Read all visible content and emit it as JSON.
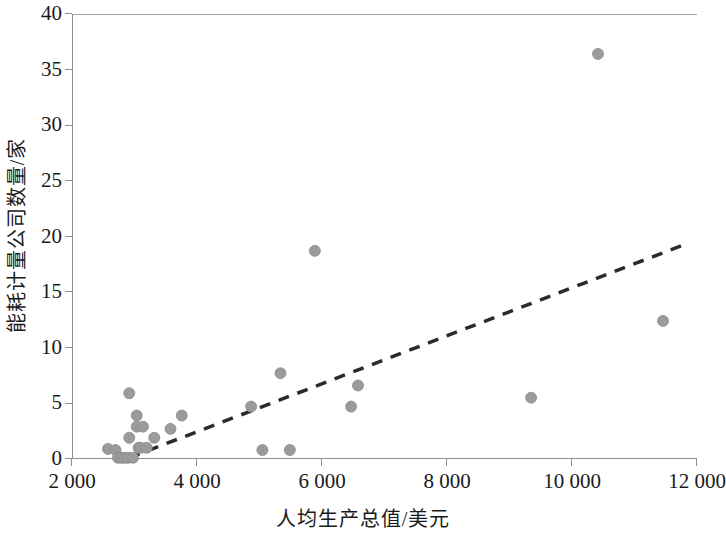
{
  "chart_data": {
    "type": "scatter",
    "title": "",
    "subtitle": "",
    "xlabel": "人均生产总值/美元",
    "ylabel": "能耗计量公司数量/家",
    "xlim": [
      2000,
      12000
    ],
    "ylim": [
      0,
      40
    ],
    "xticks": [
      2000,
      4000,
      6000,
      8000,
      10000,
      12000
    ],
    "xtick_labels": [
      "2 000",
      "4 000",
      "6 000",
      "8 000",
      "10 000",
      "12 000"
    ],
    "yticks": [
      0,
      5,
      10,
      15,
      20,
      25,
      30,
      35,
      40
    ],
    "ytick_labels": [
      "0",
      "5",
      "10",
      "15",
      "20",
      "25",
      "30",
      "35",
      "40"
    ],
    "grid": false,
    "legend": null,
    "marker": {
      "shape": "circle",
      "color": "#9b9b9b",
      "edge_color": "#8a8a8a",
      "size_px": 11
    },
    "series": [
      {
        "name": "能耗计量公司数量",
        "points": [
          {
            "x": 2560,
            "y": 1.0
          },
          {
            "x": 2680,
            "y": 0.9
          },
          {
            "x": 2720,
            "y": 0.2
          },
          {
            "x": 2780,
            "y": 0.2
          },
          {
            "x": 2830,
            "y": 0.2
          },
          {
            "x": 2880,
            "y": 0.2
          },
          {
            "x": 2900,
            "y": 6.0
          },
          {
            "x": 2900,
            "y": 2.0
          },
          {
            "x": 2960,
            "y": 0.2
          },
          {
            "x": 3020,
            "y": 4.0
          },
          {
            "x": 3020,
            "y": 3.0
          },
          {
            "x": 3050,
            "y": 1.1
          },
          {
            "x": 3080,
            "y": 1.1
          },
          {
            "x": 3120,
            "y": 3.0
          },
          {
            "x": 3180,
            "y": 1.1
          },
          {
            "x": 3300,
            "y": 2.0
          },
          {
            "x": 3560,
            "y": 2.8
          },
          {
            "x": 3740,
            "y": 4.0
          },
          {
            "x": 4850,
            "y": 4.8
          },
          {
            "x": 5030,
            "y": 0.9
          },
          {
            "x": 5320,
            "y": 7.8
          },
          {
            "x": 5470,
            "y": 0.9
          },
          {
            "x": 5870,
            "y": 18.8
          },
          {
            "x": 6450,
            "y": 4.8
          },
          {
            "x": 6560,
            "y": 6.7
          },
          {
            "x": 9330,
            "y": 5.6
          },
          {
            "x": 10400,
            "y": 36.5
          },
          {
            "x": 11440,
            "y": 12.5
          }
        ]
      }
    ],
    "trendline": {
      "style": "dashed",
      "color": "#2b2b2b",
      "width_px": 3.5,
      "x_start": 2900,
      "y_start": 0.2,
      "x_end": 11800,
      "y_end": 19.4
    }
  }
}
